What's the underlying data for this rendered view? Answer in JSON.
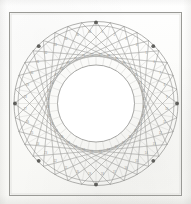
{
  "figure": {
    "caption": "",
    "background_color": "#fbfbf9",
    "frame": {
      "name": "border-frame",
      "x": 9,
      "y": 12,
      "width": 173,
      "height": 184,
      "stroke_color": "#9a9a96",
      "stroke_width": 1
    },
    "circle": {
      "center_x": 96,
      "center_y": 103.5,
      "outer_radius": 82,
      "inner_ring_radius": 78,
      "envelope_radius": 38.5,
      "divisions": 36,
      "chord_step": 11,
      "radial_spoke_count": 36,
      "marker_count": 8,
      "marker_step": 4
    },
    "colors": {
      "outer_circle": "#8e8e8b",
      "inner_circle": "#8a8a87",
      "chord_line": "#a7a7a3",
      "radial_line": "#b2b2ae",
      "marker_fill": "#4a4a47",
      "label_text": "#8d8d8a",
      "paper": "#fbfbf9",
      "frame_line": "#9a9a96"
    },
    "cell_labels": [
      "1",
      "2",
      "3",
      "4",
      "5",
      "6",
      "7",
      "8",
      "9",
      "10",
      "11",
      "12",
      "13",
      "14",
      "15",
      "16",
      "17",
      "18",
      "19",
      "20",
      "21",
      "22",
      "23",
      "24",
      "25",
      "26",
      "27",
      "28",
      "29",
      "30",
      "31",
      "32",
      "33",
      "34",
      "35",
      "36"
    ],
    "inner_labels": [
      "37",
      "38",
      "39",
      "40",
      "41",
      "42",
      "43",
      "44",
      "45",
      "46",
      "47",
      "48",
      "49",
      "50",
      "51",
      "52",
      "53",
      "54",
      "55",
      "56",
      "57",
      "58",
      "59",
      "60",
      "61",
      "62",
      "63",
      "64",
      "65",
      "66",
      "67",
      "68",
      "69",
      "70",
      "71",
      "72"
    ]
  },
  "chart_data": {
    "type": "scatter",
    "subtitle": "",
    "xlabel": "",
    "ylabel": "",
    "grid": false,
    "legend_position": "none",
    "xlim": [
      -82,
      82
    ],
    "ylim": [
      -82,
      82
    ],
    "divisions": 36,
    "chord_step": 11,
    "outer_radius": 82,
    "inner_envelope_radius": 38.5,
    "marker_angles_deg": [
      0,
      45,
      90,
      135,
      180,
      225,
      270,
      315
    ],
    "series": [
      {
        "name": "outer-circle",
        "kind": "circle",
        "radius": 82,
        "values": [
          82
        ]
      },
      {
        "name": "inner-guide-circle",
        "kind": "circle",
        "radius": 78,
        "values": [
          78
        ]
      },
      {
        "name": "envelope-circle",
        "kind": "circle",
        "radius": 38.5,
        "values": [
          38.5
        ]
      },
      {
        "name": "chords",
        "kind": "chord-set",
        "count": 36,
        "step": 11,
        "values": [
          11
        ]
      },
      {
        "name": "chords-mirror",
        "kind": "chord-set",
        "count": 36,
        "step": 25,
        "values": [
          25
        ]
      },
      {
        "name": "radial-spokes",
        "kind": "radial-set",
        "count": 36,
        "inner_radius": 38.5,
        "outer_radius": 82,
        "values": [
          36
        ]
      },
      {
        "name": "node-markers",
        "kind": "points",
        "count": 8,
        "values": [
          0,
          45,
          90,
          135,
          180,
          225,
          270,
          315
        ]
      }
    ]
  }
}
